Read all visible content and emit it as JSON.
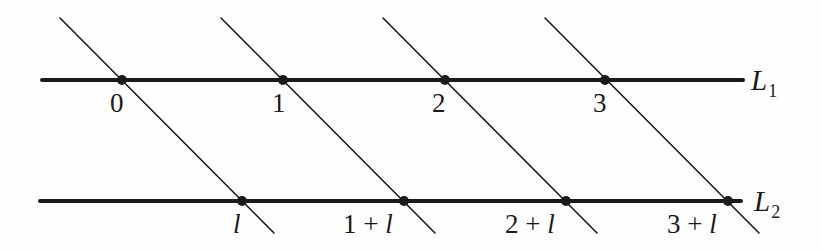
{
  "figure": {
    "background_color": "#fefefe",
    "ink_color": "#1a1a1a",
    "horizontal_lines": [
      {
        "id": "L1",
        "label": "L",
        "subscript": "1",
        "y": 80,
        "x_start": 42,
        "x_end": 743,
        "stroke_width": 4,
        "label_x": 751,
        "label_y": 66
      },
      {
        "id": "L2",
        "label": "L",
        "subscript": "2",
        "y": 201,
        "x_start": 40,
        "x_end": 741,
        "stroke_width": 4,
        "label_x": 754,
        "label_y": 187
      }
    ],
    "transversals": [
      {
        "id": "t0",
        "x_top": 60,
        "y_top": 18,
        "x_bottom": 274,
        "y_bottom": 233,
        "stroke_width": 1.6
      },
      {
        "id": "t1",
        "x_top": 221,
        "y_top": 18,
        "x_bottom": 435,
        "y_bottom": 233,
        "stroke_width": 1.6
      },
      {
        "id": "t2",
        "x_top": 383,
        "y_top": 18,
        "x_bottom": 597,
        "y_bottom": 233,
        "stroke_width": 1.6
      },
      {
        "id": "t3",
        "x_top": 545,
        "y_top": 18,
        "x_bottom": 759,
        "y_bottom": 233,
        "stroke_width": 1.6
      }
    ],
    "points_upper": [
      {
        "label": "0",
        "x": 122,
        "y": 80,
        "label_x": 110,
        "label_y": 90
      },
      {
        "label": "1",
        "x": 283,
        "y": 80,
        "label_x": 272,
        "label_y": 90
      },
      {
        "label": "2",
        "x": 445,
        "y": 80,
        "label_x": 432,
        "label_y": 90
      },
      {
        "label": "3",
        "x": 605,
        "y": 80,
        "label_x": 593,
        "label_y": 90
      }
    ],
    "points_lower": [
      {
        "label_prefix": "",
        "label_var": "l",
        "x": 242,
        "y": 201,
        "label_x": 233,
        "label_y": 211
      },
      {
        "label_prefix": "1 + ",
        "label_var": "l",
        "x": 404,
        "y": 201,
        "label_x": 343,
        "label_y": 211
      },
      {
        "label_prefix": "2 + ",
        "label_var": "l",
        "x": 566,
        "y": 201,
        "label_x": 505,
        "label_y": 211
      },
      {
        "label_prefix": "3 + ",
        "label_var": "l",
        "x": 728,
        "y": 201,
        "label_x": 667,
        "label_y": 211
      }
    ],
    "point_radius": 5
  }
}
